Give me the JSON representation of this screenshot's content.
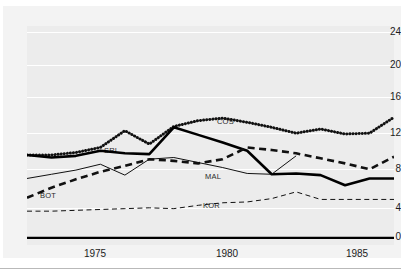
{
  "figure": {
    "title_partial": "",
    "background": "#ffffff",
    "plot_background": "#ececec",
    "gridline_color": "#ffffff",
    "axis_color": "#000000"
  },
  "axes": {
    "y_ticks": [
      "0",
      "4",
      "8",
      "12",
      "16",
      "20",
      "24"
    ],
    "x_ticks": [
      "1975",
      "1980",
      "1985"
    ]
  },
  "series_labels": {
    "cos": "COS",
    "sri": "SRI",
    "bot": "BOT",
    "mal": "MAL",
    "kor": "KOR"
  },
  "chart_data": {
    "type": "line",
    "title": "",
    "xlabel": "",
    "ylabel": "",
    "xlim": [
      1972,
      1987
    ],
    "ylim": [
      0,
      26
    ],
    "y_ticks": [
      0,
      4,
      8,
      12,
      16,
      20,
      24
    ],
    "x_ticks": [
      1975,
      1980,
      1985
    ],
    "grid": "horizontal",
    "legend": "inline-labels",
    "x": [
      1972,
      1973,
      1974,
      1975,
      1976,
      1977,
      1978,
      1979,
      1980,
      1981,
      1982,
      1983,
      1984,
      1985,
      1986,
      1987
    ],
    "series": [
      {
        "name": "COS",
        "style": "thick-dotted",
        "color": "#111111",
        "values": [
          9.9,
          9.9,
          10.2,
          10.8,
          12.8,
          11.2,
          13.3,
          14.0,
          14.3,
          13.8,
          13.2,
          12.5,
          13.0,
          12.4,
          12.5,
          14.4
        ]
      },
      {
        "name": "SRI",
        "style": "thick-solid",
        "color": "#000000",
        "values": [
          9.9,
          9.6,
          9.8,
          10.4,
          10.1,
          10.0,
          13.2,
          12.3,
          11.4,
          10.4,
          7.6,
          7.7,
          7.5,
          6.3,
          7.1,
          7.1
        ]
      },
      {
        "name": "BOT",
        "style": "thick-dashed",
        "color": "#111111",
        "values": [
          4.8,
          6.0,
          7.0,
          7.9,
          8.6,
          9.4,
          9.2,
          8.9,
          9.4,
          10.8,
          10.5,
          10.1,
          9.5,
          8.9,
          8.2,
          9.7
        ]
      },
      {
        "name": "MAL",
        "style": "thin-solid",
        "color": "#111111",
        "values": [
          7.1,
          7.6,
          8.1,
          8.8,
          7.5,
          9.4,
          9.6,
          9.0,
          8.4,
          7.7,
          7.6,
          9.8,
          null,
          null,
          null,
          null
        ]
      },
      {
        "name": "KOR",
        "style": "thin-dashed",
        "color": "#111111",
        "values": [
          3.2,
          3.2,
          3.3,
          3.4,
          3.5,
          3.6,
          3.5,
          3.9,
          4.2,
          4.3,
          4.7,
          5.5,
          4.6,
          4.6,
          4.6,
          4.6
        ]
      }
    ]
  }
}
